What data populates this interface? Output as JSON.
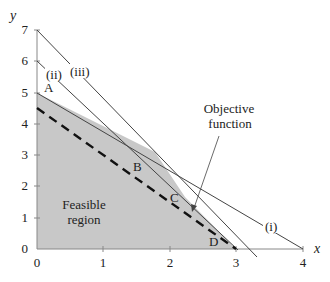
{
  "diagram": {
    "type": "linear-programming-feasible-region",
    "x_axis": {
      "label": "x",
      "ticks": [
        "0",
        "1",
        "2",
        "3",
        "4"
      ],
      "range": [
        0,
        4
      ]
    },
    "y_axis": {
      "label": "y",
      "ticks": [
        "0",
        "1",
        "2",
        "3",
        "4",
        "5",
        "6",
        "7"
      ],
      "range": [
        0,
        7
      ]
    },
    "constraints": [
      {
        "name": "(i)",
        "from": [
          0,
          5
        ],
        "to": [
          4,
          0
        ]
      },
      {
        "name": "(ii)",
        "from": [
          0,
          6
        ],
        "to": [
          3,
          0
        ]
      },
      {
        "name": "(iii)",
        "from": [
          0,
          7
        ],
        "to": [
          3.2,
          0
        ]
      }
    ],
    "vertices": [
      {
        "name": "A",
        "point": [
          0,
          5
        ]
      },
      {
        "name": "B",
        "point": [
          1.75,
          2.8
        ]
      },
      {
        "name": "C",
        "point": [
          2.3,
          1.4
        ]
      },
      {
        "name": "D",
        "point": [
          3,
          0
        ]
      }
    ],
    "objective_line": {
      "from": [
        0,
        4.5
      ],
      "to": [
        3,
        0
      ],
      "style": "dashed"
    },
    "labels": {
      "feasible_region": [
        "Feasible",
        "region"
      ],
      "objective_function": [
        "Objective",
        "function"
      ],
      "line_i": "(i)",
      "line_ii": "(ii)",
      "line_iii": "(iii)",
      "A": "A",
      "B": "B",
      "C": "C",
      "D": "D",
      "x": "x",
      "y": "y"
    },
    "colors": {
      "region_fill": "#c8c8c8",
      "line": "#333333"
    }
  }
}
